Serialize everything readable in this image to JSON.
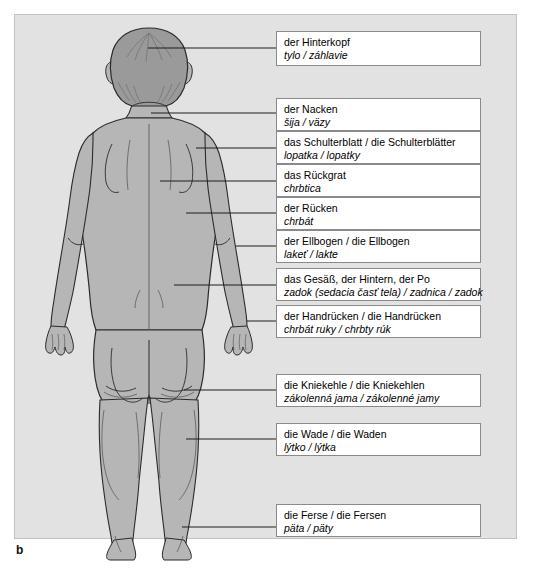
{
  "figure": {
    "caption": "b",
    "panel_bg": "#e2e2e2",
    "body_fill": "#b6b6b6",
    "hair_fill": "#9a9a9a",
    "outline": "#2b2b2b",
    "view": "human body, back view"
  },
  "labels": [
    {
      "key": "hinterkopf",
      "de": "der Hinterkopf",
      "sk": "tylo / záhlavie",
      "box": {
        "left": 276,
        "top": 31,
        "width": 205,
        "height": 35
      },
      "leader": {
        "x1": 148,
        "y1": 48,
        "x2": 276,
        "y2": 48
      }
    },
    {
      "key": "nacken",
      "de": "der Nacken",
      "sk": "šija / väzy",
      "box": {
        "left": 276,
        "top": 98,
        "width": 205,
        "height": 33
      },
      "leader": {
        "x1": 151,
        "y1": 113,
        "x2": 276,
        "y2": 113
      }
    },
    {
      "key": "schulterblatt",
      "de": "das Schulterblatt / die Schulterblätter",
      "sk": "lopatka / lopatky",
      "box": {
        "left": 276,
        "top": 131,
        "width": 205,
        "height": 33
      },
      "leader": {
        "x1": 196,
        "y1": 148,
        "x2": 276,
        "y2": 148
      }
    },
    {
      "key": "rueckgrat",
      "de": "das Rückgrat",
      "sk": "chrbtica",
      "box": {
        "left": 276,
        "top": 164,
        "width": 205,
        "height": 33
      },
      "leader": {
        "x1": 160,
        "y1": 181,
        "x2": 276,
        "y2": 181
      }
    },
    {
      "key": "ruecken",
      "de": "der Rücken",
      "sk": "chrbát",
      "box": {
        "left": 276,
        "top": 197,
        "width": 205,
        "height": 33
      },
      "leader": {
        "x1": 186,
        "y1": 213,
        "x2": 276,
        "y2": 213
      }
    },
    {
      "key": "ellbogen",
      "de": "der Ellbogen / die Ellbogen",
      "sk": "lakeť / lakte",
      "box": {
        "left": 276,
        "top": 230,
        "width": 205,
        "height": 33
      },
      "leader": {
        "x1": 236,
        "y1": 246,
        "x2": 276,
        "y2": 246
      }
    },
    {
      "key": "gesaess",
      "de": "das Gesäß, der Hintern, der Po",
      "sk": "zadok (sedacia časť tela) / zadnica / zadok",
      "box": {
        "left": 276,
        "top": 268,
        "width": 205,
        "height": 33
      },
      "leader": {
        "x1": 174,
        "y1": 285,
        "x2": 276,
        "y2": 285
      }
    },
    {
      "key": "handruecken",
      "de": "der Handrücken / die Handrücken",
      "sk": "chrbát ruky / chrbty rúk",
      "box": {
        "left": 276,
        "top": 305,
        "width": 205,
        "height": 33
      },
      "leader": {
        "x1": 247,
        "y1": 321,
        "x2": 276,
        "y2": 321
      }
    },
    {
      "key": "kniekehle",
      "de": "die Kniekehle / die Kniekehlen",
      "sk": "zákolenná jama / zákolenné jamy",
      "box": {
        "left": 276,
        "top": 374,
        "width": 205,
        "height": 33
      },
      "leader": {
        "x1": 184,
        "y1": 390,
        "x2": 276,
        "y2": 390
      }
    },
    {
      "key": "wade",
      "de": "die Wade / die Waden",
      "sk": "lýtko / lýtka",
      "box": {
        "left": 276,
        "top": 423,
        "width": 205,
        "height": 33
      },
      "leader": {
        "x1": 186,
        "y1": 439,
        "x2": 276,
        "y2": 439
      }
    },
    {
      "key": "ferse",
      "de": "die Ferse / die Fersen",
      "sk": "päta / päty",
      "box": {
        "left": 276,
        "top": 504,
        "width": 205,
        "height": 33
      },
      "leader": {
        "x1": 182,
        "y1": 527,
        "x2": 276,
        "y2": 527
      }
    }
  ]
}
